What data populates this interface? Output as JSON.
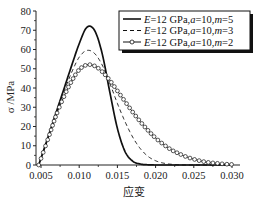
{
  "chart_data": {
    "type": "line",
    "title": "",
    "xlabel": "应变",
    "ylabel": "σ /MPa",
    "xlim": [
      0.0043,
      0.0305
    ],
    "ylim": [
      0,
      80
    ],
    "x_ticks": [
      "0.005",
      "0.010",
      "0.015",
      "0.020",
      "0.025",
      "0.030"
    ],
    "y_ticks": [
      "0",
      "10",
      "20",
      "30",
      "40",
      "50",
      "60",
      "70",
      "80"
    ],
    "grid": false,
    "legend_position": "upper right",
    "x": [
      0.0047,
      0.006,
      0.007,
      0.008,
      0.009,
      0.01,
      0.011,
      0.012,
      0.013,
      0.014,
      0.015,
      0.016,
      0.017,
      0.018,
      0.019,
      0.02,
      0.021,
      0.022,
      0.023,
      0.024,
      0.025,
      0.026,
      0.027,
      0.028,
      0.029,
      0.03
    ],
    "series": [
      {
        "name": "E=12 GPa,a=10,m=5",
        "style": "solid",
        "values": [
          0,
          15.5,
          27.5,
          39.5,
          51.5,
          63,
          71.5,
          70,
          58,
          38,
          19,
          7,
          2,
          0.5,
          0.1,
          0,
          0,
          0,
          0,
          0,
          0,
          0,
          0,
          0,
          0,
          0
        ]
      },
      {
        "name": "E=12 GPa,a=10,m=3",
        "style": "dashed",
        "values": [
          0,
          15,
          27,
          38,
          48,
          56,
          59.5,
          58,
          52,
          42.5,
          32,
          22.5,
          14.5,
          8.5,
          4.5,
          2.2,
          1,
          0.4,
          0.1,
          0,
          0,
          0,
          0,
          0,
          0,
          0
        ]
      },
      {
        "name": "E=12 GPa,a=10,m=2",
        "style": "circle-markers",
        "values": [
          0,
          14.5,
          26,
          35.5,
          43.5,
          49.5,
          52,
          51.5,
          48.5,
          44,
          38.5,
          33,
          27.5,
          22.5,
          18,
          14,
          10.8,
          8,
          6,
          4.3,
          3,
          2,
          1.3,
          0.9,
          0.5,
          0.3
        ]
      }
    ]
  },
  "legend": {
    "items": [
      {
        "E": "E",
        "rest1": "=12 GPa,",
        "a": "a",
        "rest2": "=10,",
        "m": "m",
        "rest3": "=5"
      },
      {
        "E": "E",
        "rest1": "=12 GPa,",
        "a": "a",
        "rest2": "=10,",
        "m": "m",
        "rest3": "=3"
      },
      {
        "E": "E",
        "rest1": "=12 GPa,",
        "a": "a",
        "rest2": "=10,",
        "m": "m",
        "rest3": "=2"
      }
    ]
  },
  "colors": {
    "line": "#111111",
    "axis": "#222222",
    "background": "#ffffff"
  }
}
